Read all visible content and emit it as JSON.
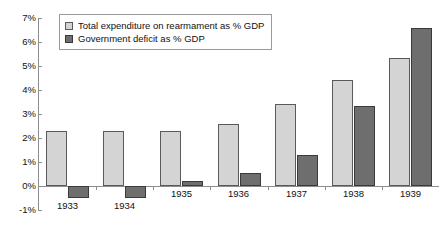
{
  "chart_data": {
    "type": "bar",
    "title": "",
    "subtitle": "",
    "xlabel": "",
    "ylabel": "",
    "categories": [
      "1933",
      "1934",
      "1935",
      "1936",
      "1937",
      "1938",
      "1939"
    ],
    "series": [
      {
        "name": "Total expenditure on rearmament as % GDP",
        "color": "#d4d4d4",
        "values": [
          2.3,
          2.3,
          2.3,
          2.6,
          3.4,
          4.4,
          5.35
        ]
      },
      {
        "name": "Government deficit as % GDP",
        "color": "#6e6e6e",
        "values": [
          -0.5,
          -0.5,
          0.2,
          0.55,
          1.3,
          3.35,
          6.6
        ]
      }
    ],
    "ylim": [
      -1,
      7
    ],
    "ytick_values": [
      7,
      6,
      5,
      4,
      3,
      2,
      1,
      0,
      -1
    ],
    "ytick_labels": [
      "7%",
      "6%",
      "5%",
      "4%",
      "3%",
      "2%",
      "1%",
      "0%",
      "-1%"
    ],
    "grid": false,
    "legend_position": "top-left",
    "axis_color": "#8d8d8d",
    "text_color": "#111111",
    "background": "#ffffff"
  },
  "legend": {
    "entries": [
      {
        "label": "Total expenditure on rearmament as % GDP",
        "swatch": "light"
      },
      {
        "label": "Government deficit as % GDP",
        "swatch": "dark"
      }
    ]
  }
}
